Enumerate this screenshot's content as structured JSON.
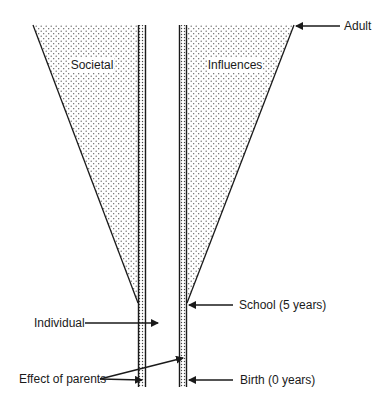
{
  "diagram": {
    "type": "funnel",
    "regions": {
      "left": "Societal",
      "right": "Influences"
    },
    "labels": {
      "adult": "Adult",
      "school": "School (5 years)",
      "individual": "Individual",
      "effect_of_parents": "Effect of parents",
      "birth": "Birth (0 years)"
    },
    "colors": {
      "line": "#1a1a1a",
      "stipple": "#555555",
      "background": "#ffffff"
    }
  }
}
